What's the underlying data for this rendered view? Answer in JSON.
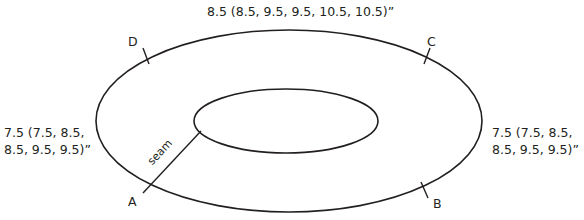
{
  "diagram": {
    "top_measurement": "8.5 (8.5, 9.5, 9.5, 10.5, 10.5)”",
    "left_measurement_line1": "7.5 (7.5, 8.5,",
    "left_measurement_line2": "8.5, 9.5, 9.5)”",
    "right_measurement_line1": "7.5 (7.5, 8.5,",
    "right_measurement_line2": "8.5, 9.5, 9.5)”",
    "seam_label": "seam",
    "points": {
      "a": "A",
      "b": "B",
      "c": "C",
      "d": "D"
    },
    "stroke_color": "#231f20"
  }
}
